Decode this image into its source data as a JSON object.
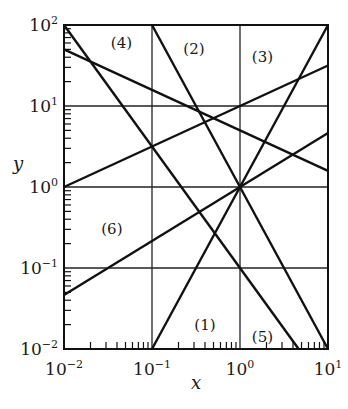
{
  "chart_data": {
    "type": "line",
    "scale": {
      "x": "log",
      "y": "log"
    },
    "title": "",
    "xlabel": "x",
    "ylabel": "y",
    "xlim": [
      0.01,
      10
    ],
    "ylim": [
      0.01,
      100
    ],
    "grid": true,
    "x_ticks": [
      {
        "value": 0.01,
        "base": "10",
        "exp": "−2"
      },
      {
        "value": 0.1,
        "base": "10",
        "exp": "−1"
      },
      {
        "value": 1,
        "base": "10",
        "exp": "0"
      },
      {
        "value": 10,
        "base": "10",
        "exp": "1"
      }
    ],
    "y_ticks": [
      {
        "value": 0.01,
        "base": "10",
        "exp": "−2"
      },
      {
        "value": 0.1,
        "base": "10",
        "exp": "−1"
      },
      {
        "value": 1,
        "base": "10",
        "exp": "0"
      },
      {
        "value": 10,
        "base": "10",
        "exp": "1"
      },
      {
        "value": 100,
        "base": "10",
        "exp": "2"
      }
    ],
    "series": [
      {
        "name": "(1)",
        "equation": "y = x^2",
        "coef": 1,
        "power": 2,
        "x": [
          0.1,
          10
        ],
        "y": [
          0.01,
          100
        ],
        "label_pos": {
          "x": 0.4,
          "y": 0.02
        }
      },
      {
        "name": "(2)",
        "equation": "y = x^-2",
        "coef": 1,
        "power": -2,
        "x": [
          0.1,
          10
        ],
        "y": [
          100,
          0.01
        ],
        "label_pos": {
          "x": 0.3,
          "y": 50
        }
      },
      {
        "name": "(3)",
        "equation": "y = 10 x^0.5",
        "coef": 10,
        "power": 0.5,
        "x": [
          0.01,
          10
        ],
        "y": [
          1,
          31.6
        ],
        "label_pos": {
          "x": 1.8,
          "y": 40
        }
      },
      {
        "name": "(4)",
        "equation": "y = 5 x^-0.5",
        "coef": 5,
        "power": -0.5,
        "x": [
          0.01,
          10
        ],
        "y": [
          50,
          1.58
        ],
        "label_pos": {
          "x": 0.045,
          "y": 60
        }
      },
      {
        "name": "(5)",
        "equation": "y = 0.1 x^-1.5",
        "coef": 0.1,
        "power": -1.5,
        "x": [
          0.01,
          4.64
        ],
        "y": [
          100,
          0.01
        ],
        "label_pos": {
          "x": 1.8,
          "y": 0.014
        }
      },
      {
        "name": "(6)",
        "equation": "y = x^(2/3)",
        "coef": 1,
        "power": 0.6667,
        "x": [
          0.01,
          10
        ],
        "y": [
          0.0464,
          4.64
        ],
        "label_pos": {
          "x": 0.035,
          "y": 0.3
        }
      }
    ],
    "line_color": "#111111",
    "grid_color": "#222222"
  }
}
